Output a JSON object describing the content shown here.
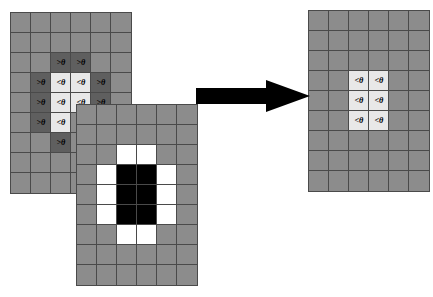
{
  "figure": {
    "type": "diagram",
    "labels": {
      "above_threshold": ">θ",
      "below_threshold": "<θ"
    },
    "colors": {
      "base_gray": "#8c8c8c",
      "dark_gray": "#5f5f5f",
      "light_gray": "#e8e8e8",
      "white": "#ffffff",
      "black": "#000000",
      "gridline": "#4a4a4a",
      "arrow": "#000000",
      "background": "#ffffff"
    }
  },
  "grids": {
    "left": {
      "name": "source-grid",
      "cols": 6,
      "rows": 9,
      "x": 10,
      "y": 12,
      "cell": 20,
      "cells": [
        [
          "base",
          ""
        ],
        [
          "base",
          ""
        ],
        [
          "base",
          ""
        ],
        [
          "base",
          ""
        ],
        [
          "base",
          ""
        ],
        [
          "base",
          ""
        ],
        [
          "base",
          ""
        ],
        [
          "base",
          ""
        ],
        [
          "base",
          ""
        ],
        [
          "base",
          ""
        ],
        [
          "base",
          ""
        ],
        [
          "base",
          ""
        ],
        [
          "base",
          ""
        ],
        [
          "base",
          ""
        ],
        [
          "dark",
          ">θ"
        ],
        [
          "dark",
          ">θ"
        ],
        [
          "base",
          ""
        ],
        [
          "base",
          ""
        ],
        [
          "base",
          ""
        ],
        [
          "dark",
          ">θ"
        ],
        [
          "light",
          "<θ"
        ],
        [
          "light",
          "<θ"
        ],
        [
          "dark",
          ">θ"
        ],
        [
          "base",
          ""
        ],
        [
          "base",
          ""
        ],
        [
          "dark",
          ">θ"
        ],
        [
          "light",
          "<θ"
        ],
        [
          "light",
          "<θ"
        ],
        [
          "dark",
          ">θ"
        ],
        [
          "base",
          ""
        ],
        [
          "base",
          ""
        ],
        [
          "dark",
          ">θ"
        ],
        [
          "light",
          "<θ"
        ],
        [
          "base",
          ""
        ],
        [
          "base",
          ""
        ],
        [
          "base",
          ""
        ],
        [
          "base",
          ""
        ],
        [
          "base",
          ""
        ],
        [
          "dark",
          ">θ"
        ],
        [
          "base",
          ""
        ],
        [
          "base",
          ""
        ],
        [
          "base",
          ""
        ],
        [
          "base",
          ""
        ],
        [
          "base",
          ""
        ],
        [
          "base",
          ""
        ],
        [
          "base",
          ""
        ],
        [
          "base",
          ""
        ],
        [
          "base",
          ""
        ],
        [
          "base",
          ""
        ],
        [
          "base",
          ""
        ],
        [
          "base",
          ""
        ],
        [
          "base",
          ""
        ],
        [
          "base",
          ""
        ],
        [
          "base",
          ""
        ]
      ]
    },
    "middle": {
      "name": "mask-grid",
      "cols": 6,
      "rows": 9,
      "x": 76,
      "y": 104,
      "cell": 20,
      "cells": [
        [
          "base",
          ""
        ],
        [
          "base",
          ""
        ],
        [
          "base",
          ""
        ],
        [
          "base",
          ""
        ],
        [
          "base",
          ""
        ],
        [
          "base",
          ""
        ],
        [
          "base",
          ""
        ],
        [
          "base",
          ""
        ],
        [
          "base",
          ""
        ],
        [
          "base",
          ""
        ],
        [
          "base",
          ""
        ],
        [
          "base",
          ""
        ],
        [
          "base",
          ""
        ],
        [
          "base",
          ""
        ],
        [
          "white",
          ""
        ],
        [
          "white",
          ""
        ],
        [
          "base",
          ""
        ],
        [
          "base",
          ""
        ],
        [
          "base",
          ""
        ],
        [
          "white",
          ""
        ],
        [
          "black",
          ""
        ],
        [
          "black",
          ""
        ],
        [
          "white",
          ""
        ],
        [
          "base",
          ""
        ],
        [
          "base",
          ""
        ],
        [
          "white",
          ""
        ],
        [
          "black",
          ""
        ],
        [
          "black",
          ""
        ],
        [
          "white",
          ""
        ],
        [
          "base",
          ""
        ],
        [
          "base",
          ""
        ],
        [
          "white",
          ""
        ],
        [
          "black",
          ""
        ],
        [
          "black",
          ""
        ],
        [
          "white",
          ""
        ],
        [
          "base",
          ""
        ],
        [
          "base",
          ""
        ],
        [
          "base",
          ""
        ],
        [
          "white",
          ""
        ],
        [
          "white",
          ""
        ],
        [
          "base",
          ""
        ],
        [
          "base",
          ""
        ],
        [
          "base",
          ""
        ],
        [
          "base",
          ""
        ],
        [
          "base",
          ""
        ],
        [
          "base",
          ""
        ],
        [
          "base",
          ""
        ],
        [
          "base",
          ""
        ],
        [
          "base",
          ""
        ],
        [
          "base",
          ""
        ],
        [
          "base",
          ""
        ],
        [
          "base",
          ""
        ],
        [
          "base",
          ""
        ],
        [
          "base",
          ""
        ]
      ]
    },
    "right": {
      "name": "result-grid",
      "cols": 6,
      "rows": 9,
      "x": 308,
      "y": 10,
      "cell": 20,
      "cells": [
        [
          "base",
          ""
        ],
        [
          "base",
          ""
        ],
        [
          "base",
          ""
        ],
        [
          "base",
          ""
        ],
        [
          "base",
          ""
        ],
        [
          "base",
          ""
        ],
        [
          "base",
          ""
        ],
        [
          "base",
          ""
        ],
        [
          "base",
          ""
        ],
        [
          "base",
          ""
        ],
        [
          "base",
          ""
        ],
        [
          "base",
          ""
        ],
        [
          "base",
          ""
        ],
        [
          "base",
          ""
        ],
        [
          "base",
          ""
        ],
        [
          "base",
          ""
        ],
        [
          "base",
          ""
        ],
        [
          "base",
          ""
        ],
        [
          "base",
          ""
        ],
        [
          "base",
          ""
        ],
        [
          "light",
          "<θ"
        ],
        [
          "light",
          "<θ"
        ],
        [
          "base",
          ""
        ],
        [
          "base",
          ""
        ],
        [
          "base",
          ""
        ],
        [
          "base",
          ""
        ],
        [
          "light",
          "<θ"
        ],
        [
          "light",
          "<θ"
        ],
        [
          "base",
          ""
        ],
        [
          "base",
          ""
        ],
        [
          "base",
          ""
        ],
        [
          "base",
          ""
        ],
        [
          "light",
          "<θ"
        ],
        [
          "light",
          "<θ"
        ],
        [
          "base",
          ""
        ],
        [
          "base",
          ""
        ],
        [
          "base",
          ""
        ],
        [
          "base",
          ""
        ],
        [
          "base",
          ""
        ],
        [
          "base",
          ""
        ],
        [
          "base",
          ""
        ],
        [
          "base",
          ""
        ],
        [
          "base",
          ""
        ],
        [
          "base",
          ""
        ],
        [
          "base",
          ""
        ],
        [
          "base",
          ""
        ],
        [
          "base",
          ""
        ],
        [
          "base",
          ""
        ],
        [
          "base",
          ""
        ],
        [
          "base",
          ""
        ],
        [
          "base",
          ""
        ],
        [
          "base",
          ""
        ],
        [
          "base",
          ""
        ],
        [
          "base",
          ""
        ]
      ]
    }
  },
  "arrow": {
    "name": "transform-arrow",
    "direction": "right"
  }
}
